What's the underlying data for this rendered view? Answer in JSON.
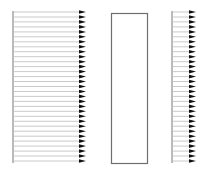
{
  "figure": {
    "width": 209,
    "height": 175,
    "background": "#ffffff",
    "colors": {
      "arrow_line": "#bdbdbd",
      "arrow_head": "#111111",
      "axis_line": "#777777",
      "rect_stroke": "#6e6e6e"
    },
    "panels": [
      {
        "name": "left-arrow-field",
        "type": "arrow-field",
        "x_start": 13,
        "x_end": 86,
        "y_start": 12,
        "y_end": 161,
        "count": 31,
        "direction": "right"
      },
      {
        "name": "middle-rectangle",
        "type": "rectangle",
        "x": 111,
        "y": 13,
        "width": 36,
        "height": 150
      },
      {
        "name": "right-arrow-field",
        "type": "arrow-field",
        "x_start": 172,
        "x_end": 196,
        "y_start": 12,
        "y_end": 161,
        "count": 31,
        "direction": "right"
      }
    ]
  }
}
